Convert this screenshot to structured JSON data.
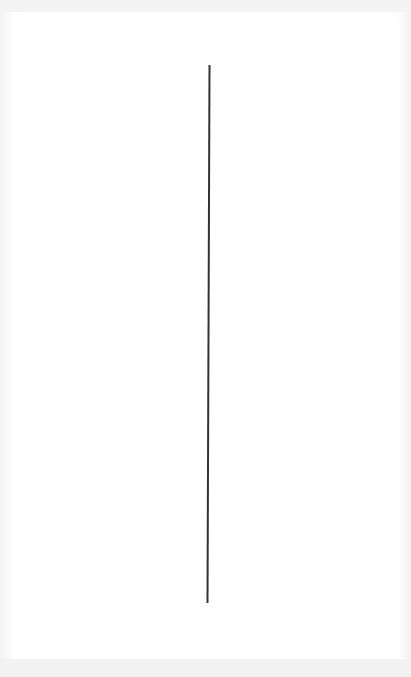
{
  "canvas": {
    "background": "#ffffff",
    "stroke": {
      "shape": "line",
      "color": "#333333",
      "width": 2,
      "x1": 209.5,
      "y1": 65,
      "x2": 207.5,
      "y2": 603
    }
  }
}
